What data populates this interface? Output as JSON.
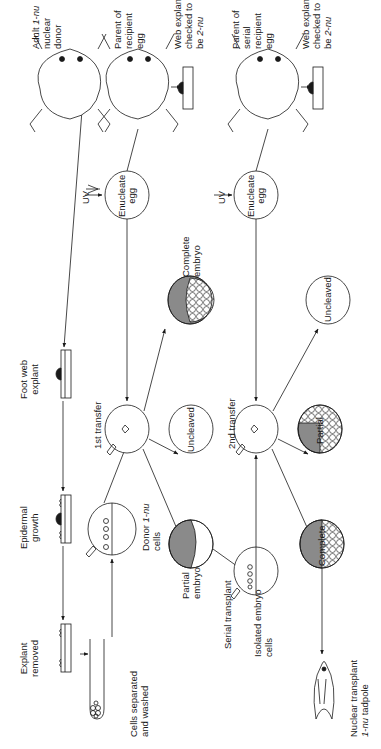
{
  "figure": {
    "type": "flow diagram",
    "orientation": "rotated 90° counter-clockwise"
  },
  "labels": {
    "explant_removed": [
      "Explant",
      "removed"
    ],
    "epidermal_growth": [
      "Epidermal",
      "growth"
    ],
    "foot_web_explant": [
      "Foot web",
      "explant"
    ],
    "adult_donor": [
      "Adult ",
      "1-nu",
      "nuclear",
      "donor"
    ],
    "cells_separated": [
      "Cells separated",
      "and washed"
    ],
    "donor_cells": [
      "Donor ",
      "1-nu",
      "cells"
    ],
    "first_transfer": "1st transfer",
    "uv_1": "UV",
    "enucleate_egg_1": [
      "Enucleate",
      "egg"
    ],
    "parent_recipient": [
      "Parent of",
      "recipient",
      "egg"
    ],
    "web_explant_1": [
      "Web explant",
      "checked to",
      "be ",
      "2-nu"
    ],
    "partial_embryo": [
      "Partial",
      "embryo"
    ],
    "uncleaved_1": "Uncleaved",
    "complete_embryo": [
      "Complete",
      "embryo"
    ],
    "serial_transplant": "Serial transplant",
    "isolated_cells": [
      "Isolated embryo",
      "cells"
    ],
    "second_transfer": "2nd transfer",
    "uv_2": "UV",
    "enucleate_egg_2": [
      "Enucleate",
      "egg"
    ],
    "parent_serial": [
      "Parent of",
      "serial",
      "recipient",
      "egg"
    ],
    "web_explant_2": [
      "Web explant",
      "checked to",
      "be ",
      "2-nu"
    ],
    "partial_2": "Partial",
    "uncleaved_2": "Uncleaved",
    "complete_2": "Complete",
    "tadpole": [
      "Nuclear transplant",
      "1-nu",
      " tadpole"
    ]
  },
  "colors": {
    "line": "#1a1a1a",
    "embryo_shade": "#8a8a8a",
    "background": "#ffffff"
  }
}
